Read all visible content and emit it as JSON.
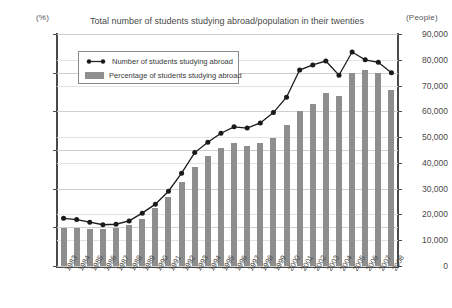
{
  "chart": {
    "title": "Total number of students studying abroad/population in their twenties",
    "left_axis_unit": "(%)",
    "right_axis_unit": "(People)"
  },
  "legend": {
    "line_label": "Number of students studying abroad",
    "bar_label": "Percentage of students studying abroad",
    "line_icon": "line-marker-icon",
    "bar_icon": "bar-swatch-icon"
  },
  "colors": {
    "bar": "#8e8e8e",
    "line": "#1a1a1a",
    "grid": "#cfcfcf",
    "axis": "#4a4a4a",
    "background": "#ffffff"
  },
  "chart_data": {
    "type": "bar",
    "title": "Total number of students studying abroad/population in their twenties",
    "xlabel": "",
    "ylabel": "(%)",
    "y2label": "(People)",
    "ylim": [
      0.0,
      0.6
    ],
    "y2lim": [
      0,
      90000
    ],
    "yticks": [
      "0.00",
      "0.10",
      "0.20",
      "0.30",
      "0.40",
      "0.50",
      "0.60"
    ],
    "ytick_values": [
      0.0,
      0.1,
      0.2,
      0.3,
      0.4,
      0.5,
      0.6
    ],
    "y2ticks": [
      "0",
      "10,000",
      "20,000",
      "30,000",
      "40,000",
      "50,000",
      "60,000",
      "70,000",
      "80,000",
      "90,000"
    ],
    "y2tick_values": [
      0,
      10000,
      20000,
      30000,
      40000,
      50000,
      60000,
      70000,
      80000,
      90000
    ],
    "grid": true,
    "legend_position": "upper left",
    "categories": [
      "1983",
      "1984",
      "1985",
      "1986",
      "1987",
      "1988",
      "1989",
      "1990",
      "1991",
      "1992",
      "1993",
      "1994",
      "1995",
      "1996",
      "1997",
      "1998",
      "1999",
      "2000",
      "2001",
      "2002",
      "2003",
      "2004",
      "2005",
      "2006",
      "2007",
      "2008"
    ],
    "series": [
      {
        "name": "Percentage of students studying abroad",
        "type": "bar",
        "axis": "left",
        "unit": "%",
        "values": [
          0.098,
          0.098,
          0.097,
          0.095,
          0.098,
          0.105,
          0.122,
          0.15,
          0.178,
          0.218,
          0.255,
          0.285,
          0.305,
          0.318,
          0.31,
          0.318,
          0.33,
          0.365,
          0.4,
          0.418,
          0.448,
          0.44,
          0.5,
          0.508,
          0.498,
          0.455
        ]
      },
      {
        "name": "Number of students studying abroad",
        "type": "line",
        "axis": "right",
        "unit": "People",
        "values": [
          18500,
          18000,
          17000,
          16000,
          16200,
          17500,
          20500,
          24000,
          29000,
          36000,
          44000,
          48000,
          51500,
          54000,
          53500,
          55500,
          59500,
          65500,
          76000,
          78000,
          79500,
          74000,
          83000,
          80000,
          79000,
          75000
        ]
      }
    ]
  }
}
